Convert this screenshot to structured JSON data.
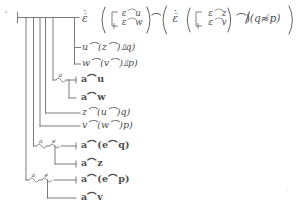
{
  "document": {
    "kind": "begriffsschrift-proof-diagram",
    "ink_color": "#4c4c4c",
    "background": "#ffffff",
    "corner_marks": {
      "top_left": "ʟ",
      "bottom_right": "ʼ"
    }
  },
  "rows": [
    {
      "id": "row-1",
      "name": "conclusion-row",
      "parts": {
        "epsilon_1": "ε̇",
        "open_paren_1": "(",
        "stack_1_upper": "ε⌒u",
        "stack_1_lower": "ε⌒w",
        "close_paren_1": ")",
        "conn_1": "⌒",
        "open_paren_2": "(",
        "epsilon_2": "ε̇",
        "open_paren_3": "(",
        "stack_2_upper": "ε⌒z",
        "stack_2_lower": "ε⌒v",
        "close_paren_3": ")",
        "conn_2": "⌒",
        "neg_bar": ")",
        "tail": "(q≉p)",
        "close_paren_2": ")"
      },
      "plain": "ε̇(⌐ ε⌒u / ε⌒w) ⌒ (ε̇(⌐ ε⌒z / ε⌒v) ⌒) ⫫(q≉p))"
    },
    {
      "id": "row-2",
      "name": "premise-row-u",
      "text": "u⌒(z⌒)⫫q)"
    },
    {
      "id": "row-3",
      "name": "premise-row-w",
      "text": "w⌒(v⌒)⫫p)"
    },
    {
      "id": "row-4",
      "name": "premise-row-au",
      "text": "a⌒u",
      "frak": true
    },
    {
      "id": "row-5",
      "name": "premise-row-aw",
      "text": "a⌒w",
      "frak": true
    },
    {
      "id": "row-6",
      "name": "premise-row-z",
      "text": "z⌒(u⌒)q)"
    },
    {
      "id": "row-7",
      "name": "premise-row-v",
      "text": "v⌒(w⌒)p)"
    },
    {
      "id": "row-8",
      "name": "premise-row-aeq",
      "text": "a⌒(e⌒q)",
      "frak": true
    },
    {
      "id": "row-9",
      "name": "premise-row-az",
      "text": "a⌒z",
      "frak": true
    },
    {
      "id": "row-10",
      "name": "premise-row-aep",
      "text": "a⌒(e⌒p)",
      "frak": true
    },
    {
      "id": "row-11",
      "name": "premise-row-av",
      "text": "a⌒v",
      "frak": true
    }
  ],
  "brace_labels": [
    {
      "id": "brace-a-1",
      "label": "a"
    },
    {
      "id": "brace-a-2",
      "label": "a"
    },
    {
      "id": "brace-e-1",
      "label": "e"
    },
    {
      "id": "brace-a-3",
      "label": "a"
    },
    {
      "id": "brace-e-2",
      "label": "e"
    }
  ]
}
